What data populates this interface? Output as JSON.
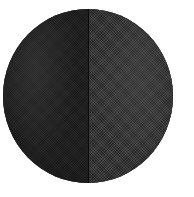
{
  "figure": {
    "caption": "",
    "background_color": "#ffffff",
    "width": 194,
    "height": 197
  },
  "disc": {
    "shape": "circle",
    "center_x": 88,
    "center_y": 96,
    "radius_x": 85,
    "radius_y": 87,
    "outline_color": "#1a1a1a",
    "split": {
      "orientation": "vertical",
      "position_x": 88,
      "divider_color": "#0a0a0a"
    },
    "halves": [
      {
        "side": "left",
        "label": "",
        "fill_color": "#1f1f1f",
        "texture": "fine-dither",
        "relative_tone": "darker"
      },
      {
        "side": "right",
        "label": "",
        "fill_color": "#363636",
        "texture": "coarse-dither",
        "relative_tone": "lighter"
      }
    ]
  }
}
